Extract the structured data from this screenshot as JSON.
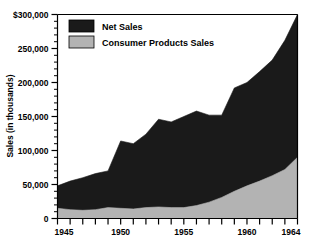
{
  "chart_data": {
    "type": "area",
    "title": "",
    "subtitle": "",
    "xlabel": "",
    "ylabel": "Sales (in thousands)",
    "xlim": [
      1945,
      1964
    ],
    "ylim": [
      0,
      300000
    ],
    "grid": false,
    "stacked": true,
    "legend_position": "top-left-inside",
    "x": [
      1945,
      1946,
      1947,
      1948,
      1949,
      1950,
      1951,
      1952,
      1953,
      1954,
      1955,
      1956,
      1957,
      1958,
      1959,
      1960,
      1961,
      1962,
      1963,
      1964
    ],
    "series": [
      {
        "name": "Net Sales",
        "color": "#1a1a1a",
        "values": [
          48000,
          55000,
          60000,
          66000,
          70000,
          114000,
          110000,
          124000,
          146000,
          142000,
          150000,
          158000,
          152000,
          152000,
          192000,
          200000,
          216000,
          233000,
          262000,
          300000
        ]
      },
      {
        "name": "Consumer Products Sales",
        "color": "#b3b3b3",
        "values": [
          15000,
          13000,
          12000,
          13000,
          16000,
          15000,
          14000,
          16000,
          17000,
          16000,
          16000,
          19000,
          24000,
          31000,
          40000,
          48000,
          55000,
          63000,
          72000,
          90000
        ]
      }
    ],
    "y_ticks": [
      {
        "value": 0,
        "label": "0"
      },
      {
        "value": 50000,
        "label": "50,000"
      },
      {
        "value": 100000,
        "label": "100,000"
      },
      {
        "value": 150000,
        "label": "150,000"
      },
      {
        "value": 200000,
        "label": "200,000"
      },
      {
        "value": 250000,
        "label": "250,000"
      },
      {
        "value": 300000,
        "label": "$300,000"
      }
    ],
    "y_minor_tick_step": 10000,
    "x_ticks": [
      {
        "value": 1945,
        "label": "1945"
      },
      {
        "value": 1946,
        "label": ""
      },
      {
        "value": 1947,
        "label": ""
      },
      {
        "value": 1948,
        "label": ""
      },
      {
        "value": 1949,
        "label": ""
      },
      {
        "value": 1950,
        "label": "1950"
      },
      {
        "value": 1951,
        "label": ""
      },
      {
        "value": 1952,
        "label": ""
      },
      {
        "value": 1953,
        "label": ""
      },
      {
        "value": 1954,
        "label": ""
      },
      {
        "value": 1955,
        "label": "1955"
      },
      {
        "value": 1956,
        "label": ""
      },
      {
        "value": 1957,
        "label": ""
      },
      {
        "value": 1958,
        "label": ""
      },
      {
        "value": 1959,
        "label": ""
      },
      {
        "value": 1960,
        "label": "1960"
      },
      {
        "value": 1961,
        "label": ""
      },
      {
        "value": 1962,
        "label": ""
      },
      {
        "value": 1963,
        "label": ""
      },
      {
        "value": 1964,
        "label": "1964"
      }
    ],
    "legend": [
      {
        "label": "Net Sales",
        "color": "#1a1a1a"
      },
      {
        "label": "Consumer Products Sales",
        "color": "#b3b3b3"
      }
    ]
  }
}
